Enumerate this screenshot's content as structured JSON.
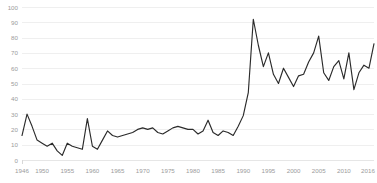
{
  "chart_data": {
    "type": "line",
    "title": "",
    "subtitle": "",
    "xlabel": "",
    "ylabel": "",
    "xlim": [
      1946,
      2016
    ],
    "ylim": [
      0,
      100
    ],
    "grid": true,
    "legend": null,
    "legend_position": "none",
    "line_color": "#2b2b2b",
    "grid_color": "#efefef",
    "axis_text_color": "#9b9b9b",
    "background": "#ffffff",
    "y_ticks": [
      0,
      10,
      20,
      30,
      40,
      50,
      60,
      70,
      80,
      90,
      100
    ],
    "y_tick_labels": [
      "0",
      "10",
      "20",
      "30",
      "40",
      "50",
      "60",
      "70",
      "80",
      "90",
      "100"
    ],
    "x_ticks": [
      1946,
      1950,
      1955,
      1960,
      1965,
      1970,
      1975,
      1980,
      1985,
      1990,
      1995,
      2000,
      2005,
      2010,
      2016
    ],
    "x_tick_labels": [
      "1946",
      "1950",
      "1955",
      "1960",
      "1965",
      "1970",
      "1975",
      "1980",
      "1985",
      "1990",
      "1995",
      "2000",
      "2005",
      "2010",
      "2016"
    ],
    "x": [
      1946,
      1947,
      1948,
      1949,
      1950,
      1951,
      1952,
      1953,
      1954,
      1955,
      1956,
      1957,
      1958,
      1959,
      1960,
      1961,
      1962,
      1963,
      1964,
      1965,
      1966,
      1967,
      1968,
      1969,
      1970,
      1971,
      1972,
      1973,
      1974,
      1975,
      1976,
      1977,
      1978,
      1979,
      1980,
      1981,
      1982,
      1983,
      1984,
      1985,
      1986,
      1987,
      1988,
      1989,
      1990,
      1991,
      1992,
      1993,
      1994,
      1995,
      1996,
      1997,
      1998,
      1999,
      2000,
      2001,
      2002,
      2003,
      2004,
      2005,
      2006,
      2007,
      2008,
      2009,
      2010,
      2011,
      2012,
      2013,
      2014,
      2015,
      2016
    ],
    "values": [
      16,
      30,
      22,
      13,
      11,
      9,
      11,
      6,
      3,
      11,
      9,
      8,
      7,
      27,
      9,
      7,
      13,
      19,
      16,
      15,
      16,
      17,
      18,
      20,
      21,
      20,
      21,
      18,
      17,
      19,
      21,
      22,
      21,
      20,
      20,
      17,
      19,
      26,
      18,
      16,
      19,
      18,
      16,
      22,
      29,
      44,
      92,
      75,
      61,
      70,
      56,
      50,
      60,
      54,
      48,
      55,
      56,
      64,
      70,
      81,
      57,
      52,
      61,
      65,
      53,
      70,
      46,
      57,
      62,
      60,
      76
    ],
    "series": [
      {
        "name": "value",
        "values": [
          16,
          30,
          22,
          13,
          11,
          9,
          11,
          6,
          3,
          11,
          9,
          8,
          7,
          27,
          9,
          7,
          13,
          19,
          16,
          15,
          16,
          17,
          18,
          20,
          21,
          20,
          21,
          18,
          17,
          19,
          21,
          22,
          21,
          20,
          20,
          17,
          19,
          26,
          18,
          16,
          19,
          18,
          16,
          22,
          29,
          44,
          92,
          75,
          61,
          70,
          56,
          50,
          60,
          54,
          48,
          55,
          56,
          64,
          70,
          81,
          57,
          52,
          61,
          65,
          53,
          70,
          46,
          57,
          62,
          60,
          76
        ]
      }
    ]
  }
}
